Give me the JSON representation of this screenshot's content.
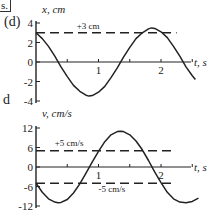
{
  "page": {
    "corner_label": "s.",
    "part_label": "(d)",
    "stray_text": "d"
  },
  "chart_data": [
    {
      "type": "line",
      "title": "",
      "ylabel": "x, cm",
      "xlabel": "t, s",
      "ylim": [
        -4,
        4
      ],
      "xlim": [
        0,
        2.6
      ],
      "yticks": [
        -4,
        -2,
        0,
        2,
        4
      ],
      "ytick_labels": [
        "-4",
        "-2",
        "0",
        "2",
        "4"
      ],
      "xticks": [
        0.5,
        1,
        1.5,
        2,
        2.5
      ],
      "xtick_labels": [
        "",
        "1",
        "",
        "2",
        ""
      ],
      "grid": false,
      "series": [
        {
          "name": "x(t)",
          "style": "solid",
          "x": [
            0,
            0.1,
            0.2,
            0.3,
            0.4,
            0.5,
            0.6,
            0.7,
            0.8,
            0.85,
            0.9,
            1.0,
            1.1,
            1.2,
            1.3,
            1.4,
            1.5,
            1.6,
            1.7,
            1.8,
            1.85,
            1.9,
            2.0,
            2.1,
            2.2,
            2.3,
            2.4,
            2.5,
            2.55
          ],
          "values": [
            3.0,
            2.4,
            1.6,
            0.6,
            -0.5,
            -1.5,
            -2.4,
            -3.0,
            -3.4,
            -3.5,
            -3.45,
            -3.1,
            -2.5,
            -1.6,
            -0.6,
            0.5,
            1.5,
            2.4,
            3.0,
            3.4,
            3.5,
            3.45,
            3.1,
            2.5,
            1.6,
            0.6,
            -0.5,
            -1.4,
            -1.8
          ]
        },
        {
          "name": "+3 cm",
          "style": "dashed",
          "x": [
            0,
            2.25
          ],
          "values": [
            3,
            3
          ]
        }
      ],
      "annotations": [
        {
          "text": "+3 cm",
          "x": 0.65,
          "y": 3.4
        }
      ]
    },
    {
      "type": "line",
      "title": "",
      "ylabel": "v, cm/s",
      "xlabel": "t, s",
      "ylim": [
        -12,
        12
      ],
      "xlim": [
        0,
        2.6
      ],
      "yticks": [
        -12,
        -6,
        0,
        6,
        12
      ],
      "ytick_labels": [
        "-12",
        "-6",
        "0",
        "6",
        "12"
      ],
      "xticks": [
        0.5,
        1,
        1.5,
        2,
        2.5
      ],
      "xtick_labels": [
        "",
        "1",
        "",
        "2",
        ""
      ],
      "grid": false,
      "series": [
        {
          "name": "v(t)",
          "style": "solid",
          "x": [
            0,
            0.1,
            0.2,
            0.3,
            0.35,
            0.4,
            0.5,
            0.6,
            0.7,
            0.8,
            0.9,
            1.0,
            1.1,
            1.2,
            1.3,
            1.35,
            1.4,
            1.5,
            1.6,
            1.7,
            1.8,
            1.9,
            2.0,
            2.1,
            2.2,
            2.3,
            2.4,
            2.5,
            2.6
          ],
          "values": [
            -5.0,
            -7.8,
            -9.8,
            -10.8,
            -11.0,
            -10.9,
            -10.0,
            -8.0,
            -5.2,
            -1.9,
            1.6,
            4.8,
            7.8,
            9.9,
            10.9,
            11.0,
            10.9,
            9.9,
            8.0,
            5.3,
            2.0,
            -1.6,
            -4.8,
            -7.8,
            -9.8,
            -10.8,
            -11.0,
            -10.6,
            -9.6
          ]
        },
        {
          "name": "+5 cm/s",
          "style": "dashed",
          "x": [
            0,
            2.2
          ],
          "values": [
            5,
            5
          ]
        },
        {
          "name": "-5 cm/s",
          "style": "dashed",
          "x": [
            0,
            2.2
          ],
          "values": [
            -5,
            -5
          ]
        }
      ],
      "annotations": [
        {
          "text": "+5 cm/s",
          "x": 0.3,
          "y": 6.4
        },
        {
          "text": "-5 cm/s",
          "x": 1.0,
          "y": -7.6
        }
      ]
    }
  ]
}
